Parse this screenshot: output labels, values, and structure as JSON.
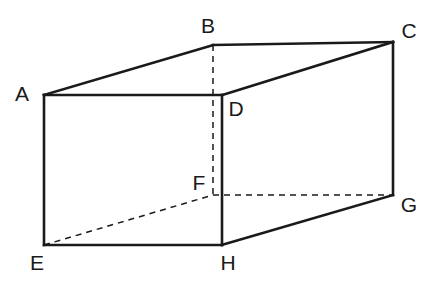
{
  "figure": {
    "kind": "cuboid",
    "stroke_color": "#1a1a1a",
    "label_color": "#1a1a1a",
    "background_color": "#ffffff",
    "visible_edge_width": 2.6,
    "hidden_edge_width": 1.5,
    "hidden_edge_dash": "6 5",
    "label_font_size": 21
  },
  "vertices": [
    {
      "id": "A",
      "label": "A",
      "x": 44,
      "y": 95,
      "label_x": 22,
      "label_y": 95,
      "hidden": false
    },
    {
      "id": "B",
      "label": "B",
      "x": 213,
      "y": 45,
      "label_x": 208,
      "label_y": 27,
      "hidden": false
    },
    {
      "id": "C",
      "label": "C",
      "x": 393,
      "y": 42,
      "label_x": 409,
      "label_y": 32,
      "hidden": false
    },
    {
      "id": "D",
      "label": "D",
      "x": 222,
      "y": 95,
      "label_x": 236,
      "label_y": 110,
      "hidden": false
    },
    {
      "id": "E",
      "label": "E",
      "x": 44,
      "y": 245,
      "label_x": 37,
      "label_y": 264,
      "hidden": false
    },
    {
      "id": "F",
      "label": "F",
      "x": 213,
      "y": 195,
      "label_x": 199,
      "label_y": 184,
      "hidden": true
    },
    {
      "id": "G",
      "label": "G",
      "x": 393,
      "y": 195,
      "label_x": 409,
      "label_y": 206,
      "hidden": false
    },
    {
      "id": "H",
      "label": "H",
      "x": 222,
      "y": 245,
      "label_x": 228,
      "label_y": 264,
      "hidden": false
    }
  ],
  "edges_visible": [
    {
      "name": "edge-AD",
      "from": "A",
      "to": "D"
    },
    {
      "name": "edge-AE",
      "from": "A",
      "to": "E"
    },
    {
      "name": "edge-AB",
      "from": "A",
      "to": "B"
    },
    {
      "name": "edge-BC",
      "from": "B",
      "to": "C"
    },
    {
      "name": "edge-CD",
      "from": "C",
      "to": "D"
    },
    {
      "name": "edge-CG",
      "from": "C",
      "to": "G"
    },
    {
      "name": "edge-DH",
      "from": "D",
      "to": "H"
    },
    {
      "name": "edge-EH",
      "from": "E",
      "to": "H"
    },
    {
      "name": "edge-GH",
      "from": "G",
      "to": "H"
    }
  ],
  "edges_hidden": [
    {
      "name": "edge-BF",
      "from": "B",
      "to": "F"
    },
    {
      "name": "edge-FG",
      "from": "F",
      "to": "G"
    },
    {
      "name": "edge-EF",
      "from": "E",
      "to": "F"
    }
  ]
}
